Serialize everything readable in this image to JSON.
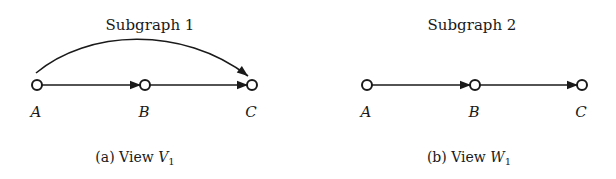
{
  "panels": [
    {
      "id": "a",
      "title": "Subgraph 1",
      "caption_prefix": "(a) View ",
      "caption_var": "V",
      "caption_sub": "1",
      "nodes": [
        "A",
        "B",
        "C"
      ],
      "edges": [
        {
          "from": "A",
          "to": "B",
          "style": "straight"
        },
        {
          "from": "B",
          "to": "C",
          "style": "straight"
        },
        {
          "from": "A",
          "to": "C",
          "style": "curved"
        }
      ]
    },
    {
      "id": "b",
      "title": "Subgraph 2",
      "caption_prefix": "(b) View ",
      "caption_var": "W",
      "caption_sub": "1",
      "nodes": [
        "A",
        "B",
        "C"
      ],
      "edges": [
        {
          "from": "A",
          "to": "B",
          "style": "straight"
        },
        {
          "from": "B",
          "to": "C",
          "style": "straight"
        }
      ]
    }
  ]
}
